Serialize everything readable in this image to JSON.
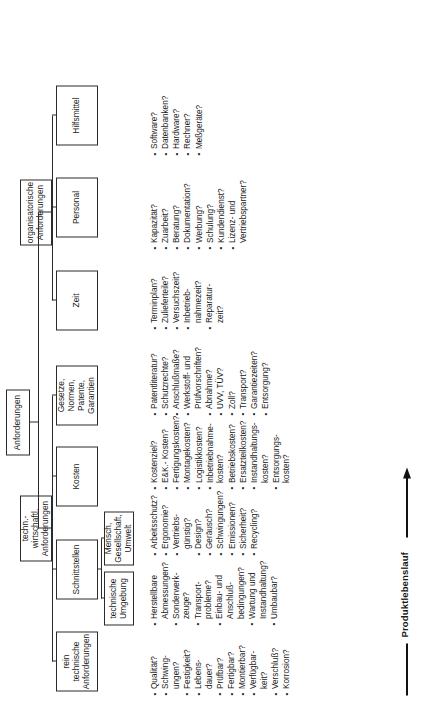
{
  "diagram": {
    "title": "Anforderungen",
    "axis_label": "Produktlebenslauf",
    "nodes": {
      "root": "Anforderungen",
      "tech_econ": "techn.-wirtschaftl.\nAnforderungen",
      "organisational": "organisatorische\nAnforderungen",
      "pure_technical": "rein\ntechnische\nAnforderungen",
      "interfaces": "Schnittstellen",
      "tech_environment": "technische\nUmgebung",
      "human_society_env": "Mensch,\nGesellschaft,\nUmwelt",
      "costs": "Kosten",
      "laws": "Gesetze,\nNormen,\nPatente,\nGarantien",
      "time": "Zeit",
      "personnel": "Personal",
      "resources": "Hilfsmittel"
    },
    "lists": {
      "pure_technical": [
        "Qualität?",
        "Schwing-\nungen?",
        "Festigkeit?",
        "Lebens-\ndauer?",
        "Prüfbar?",
        "Fertigbar?",
        "Montierbar?",
        "Verfügbar-\nkeit?",
        "Verschluß?",
        "Korrosion?"
      ],
      "tech_environment": [
        "Herstellbare\nAbmessungen?",
        "Sonderwerk-\nzeuge?",
        "Transport-\nprobleme?",
        "Einbau- und\nAnschluß-\nbedingungen?",
        "Wartung und\nInstandhaltung?",
        "Umbaubar?"
      ],
      "human_society_env": [
        "Arbeitsschutz?",
        "Ergonomie?",
        "Vertriebs-\ngünstig?",
        "Design?",
        "Geräusch?",
        "Schwingungen?",
        "Emissionen?",
        "Sicherheit?",
        "Recycling?"
      ],
      "costs": [
        "Kostenziel?",
        "E&K.- Kosten?",
        "Fertigungskosten?",
        "Montagekosten?",
        "Logistikkosten?",
        "Inbetriebnahme-\nkosten?",
        "Betriebskosten?",
        "Ersatzteilkosten?",
        "Instandhaltungs-\nkosten?",
        "Entsorgungs-\nkosten?"
      ],
      "laws": [
        "Patentliteratur?",
        "Schutzrechte?",
        "Anschlußmaße?",
        "Werkstoff- und\nPrüfvorschriften?",
        "Abnahme?",
        "UVV, TÜV?",
        "Zoll?",
        "Transport?",
        "Garantiezeiten?",
        "Entsorgung?"
      ],
      "time": [
        "Terminplan?",
        "Zulieferteile?",
        "Versuchszeit?",
        "Inbetrieb-\nnahmezeit?",
        "Reparatur-\nzeit?"
      ],
      "personnel": [
        "Kapazität?",
        "Zuarbeit?",
        "Beratung?",
        "Dokumentation?",
        "Werbung?",
        "Schulung?",
        "Kundendienst?",
        "Lizenz- und\nVertriebspartner?"
      ],
      "resources": [
        "Software?",
        "Datenbanken?",
        "Hardware?",
        "Rechner?",
        "Meßgeräte?"
      ]
    }
  }
}
